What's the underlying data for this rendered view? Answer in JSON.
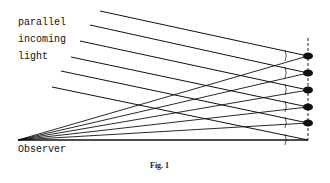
{
  "figure": {
    "caption": "Fig. 1",
    "labels": {
      "line1": "parallel",
      "line2": "incoming",
      "line3": "light",
      "observer": "Observer"
    },
    "colors": {
      "ink": "#111111",
      "background": "#ffffff"
    },
    "observer_point": [
      18,
      140
    ],
    "vertical_axis_x": 308,
    "vertical_axis_top": 38,
    "baseline_y": 140,
    "drops": [
      {
        "x": 308,
        "y": 56
      },
      {
        "x": 308,
        "y": 73
      },
      {
        "x": 308,
        "y": 90
      },
      {
        "x": 308,
        "y": 107
      },
      {
        "x": 308,
        "y": 123
      }
    ],
    "incoming_rays": [
      {
        "from": [
          100,
          11
        ],
        "to": [
          308,
          56
        ]
      },
      {
        "from": [
          90,
          25
        ],
        "to": [
          308,
          73
        ]
      },
      {
        "from": [
          80,
          41
        ],
        "to": [
          308,
          90
        ]
      },
      {
        "from": [
          71,
          57
        ],
        "to": [
          308,
          107
        ]
      },
      {
        "from": [
          61,
          71
        ],
        "to": [
          308,
          123
        ]
      },
      {
        "from": [
          52,
          87
        ],
        "to": [
          308,
          140
        ]
      }
    ]
  }
}
